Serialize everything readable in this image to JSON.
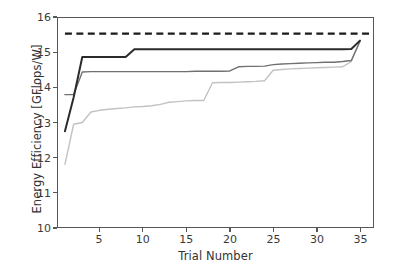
{
  "chart_data": {
    "type": "line",
    "title": "",
    "xlabel": "Trial Number",
    "ylabel": "Energy Efficiency [GFlops/W]",
    "xlim": [
      0.2,
      36.5
    ],
    "ylim": [
      10,
      16
    ],
    "xticks": [
      5,
      10,
      15,
      20,
      25,
      30,
      35
    ],
    "yticks": [
      10,
      11,
      12,
      13,
      14,
      15,
      16
    ],
    "grid": false,
    "legend": "none",
    "x": [
      1,
      2,
      3,
      4,
      5,
      6,
      7,
      8,
      9,
      10,
      11,
      12,
      13,
      14,
      15,
      16,
      17,
      18,
      19,
      20,
      21,
      22,
      23,
      24,
      25,
      26,
      27,
      28,
      29,
      30,
      31,
      32,
      33,
      34,
      35
    ],
    "series": [
      {
        "name": "dark-line",
        "color": "#2b2b2b",
        "linewidth": 2.0,
        "linestyle": "solid",
        "values": [
          12.75,
          13.72,
          14.88,
          14.88,
          14.88,
          14.88,
          14.88,
          14.88,
          15.1,
          15.1,
          15.1,
          15.1,
          15.1,
          15.1,
          15.1,
          15.1,
          15.1,
          15.1,
          15.1,
          15.1,
          15.1,
          15.1,
          15.1,
          15.1,
          15.1,
          15.1,
          15.1,
          15.1,
          15.1,
          15.1,
          15.1,
          15.1,
          15.1,
          15.11,
          15.35
        ]
      },
      {
        "name": "medium-gray-line",
        "color": "#707070",
        "linewidth": 1.4,
        "linestyle": "solid",
        "values": [
          13.8,
          13.8,
          14.45,
          14.46,
          14.46,
          14.46,
          14.46,
          14.46,
          14.46,
          14.46,
          14.46,
          14.46,
          14.46,
          14.46,
          14.46,
          14.47,
          14.47,
          14.47,
          14.47,
          14.48,
          14.6,
          14.61,
          14.61,
          14.62,
          14.66,
          14.68,
          14.69,
          14.7,
          14.71,
          14.72,
          14.73,
          14.73,
          14.75,
          14.78,
          15.33
        ]
      },
      {
        "name": "light-gray-line",
        "color": "#c2c2c2",
        "linewidth": 1.4,
        "linestyle": "solid",
        "values": [
          11.8,
          12.95,
          13.0,
          13.3,
          13.35,
          13.38,
          13.4,
          13.42,
          13.45,
          13.46,
          13.48,
          13.52,
          13.58,
          13.6,
          13.62,
          13.63,
          13.63,
          14.14,
          14.15,
          14.15,
          14.16,
          14.17,
          14.18,
          14.2,
          14.5,
          14.52,
          14.54,
          14.55,
          14.56,
          14.57,
          14.58,
          14.59,
          14.6,
          14.75,
          15.33
        ]
      }
    ],
    "reference_line": {
      "name": "dashed-reference-line",
      "value": 15.55,
      "color": "#1a1a1a",
      "linewidth": 2.2,
      "linestyle": "dashed",
      "x_start": 1.0,
      "x_end": 36.2
    }
  },
  "axes": {
    "ytick_labels": [
      "16",
      "15",
      "14",
      "13",
      "12",
      "11",
      "10"
    ],
    "xtick_labels": [
      "5",
      "10",
      "15",
      "20",
      "25",
      "30",
      "35"
    ]
  }
}
